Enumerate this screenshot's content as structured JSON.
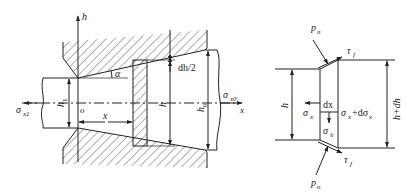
{
  "figure": {
    "type": "mechanics diagram",
    "left_panel": {
      "description": "Drawing of strip through conical die with differential slab element",
      "labels": {
        "h_axis": "h",
        "origin": "o",
        "alpha": "α",
        "dh_half": "dh/2",
        "x_dim": "x",
        "h1": "h",
        "h1_sub": "1",
        "h": "h",
        "h0": "h",
        "h0_sub": "0",
        "sigma_x1": "σ",
        "sigma_x1_sub": "x1",
        "sigma_x0": "σ",
        "sigma_x0_sub": "x0",
        "x_axis": "x"
      }
    },
    "right_panel": {
      "description": "Free-body diagram of differential element",
      "labels": {
        "pn_top": "p",
        "pn_top_sub": "n",
        "tau_top": "τ",
        "tau_top_sub": "f",
        "h_left": "h",
        "h_right": "h+dh",
        "dx": "dx",
        "sigma_x": "σ",
        "sigma_x_sub": "x",
        "sigma_x_plus": "σ",
        "sigma_x_plus_sub": "x",
        "sigma_x_plus_tail": "+dσ",
        "sigma_x_plus_tail_sub": "x",
        "sigma_h": "σ",
        "sigma_h_sub": "h",
        "pn_bottom": "p",
        "pn_bottom_sub": "n",
        "tau_bottom": "τ",
        "tau_bottom_sub": "f"
      }
    },
    "colors": {
      "stroke": "#222222",
      "background": "#ffffff"
    }
  }
}
